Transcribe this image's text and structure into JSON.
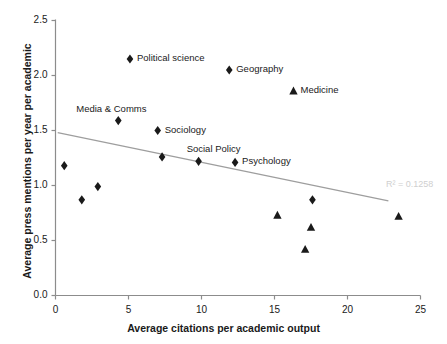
{
  "figure": {
    "title_faint": "",
    "background": "#ffffff",
    "marker_color": "#1a1a1a",
    "axis_color": "#8c8c8c",
    "trend_color": "#9e9e9e",
    "r2_color": "#cfcfcf"
  },
  "chart_data": {
    "type": "scatter",
    "title": "",
    "xlabel": "Average citations per academic output",
    "ylabel": "Average press mentions per year per academic",
    "xlim": [
      0,
      25
    ],
    "ylim": [
      0.0,
      2.5
    ],
    "xticks": [
      0,
      5,
      10,
      15,
      20,
      25
    ],
    "xtick_labels": [
      "0",
      "5",
      "10",
      "15",
      "20",
      "25"
    ],
    "yticks": [
      0.0,
      0.5,
      1.0,
      1.5,
      2.0,
      2.5
    ],
    "ytick_labels": [
      "0.0",
      "0.5",
      "1.0",
      "1.5",
      "2.0",
      "2.5"
    ],
    "grid": false,
    "legend": "none",
    "series": [
      {
        "name": "Social sciences",
        "marker": "diamond",
        "color": "#1a1a1a",
        "points": [
          {
            "x": 5.1,
            "y": 2.15,
            "label": "Political science",
            "label_pos": "right"
          },
          {
            "x": 11.9,
            "y": 2.05,
            "label": "Geography",
            "label_pos": "right"
          },
          {
            "x": 4.3,
            "y": 1.59,
            "label": "Media & Comms",
            "label_pos": "above-left"
          },
          {
            "x": 7.0,
            "y": 1.5,
            "label": "Sociology",
            "label_pos": "right"
          },
          {
            "x": 7.3,
            "y": 1.26,
            "label": "",
            "label_pos": "none"
          },
          {
            "x": 9.8,
            "y": 1.22,
            "label": "Social Policy",
            "label_pos": "above"
          },
          {
            "x": 12.3,
            "y": 1.21,
            "label": "Psychology",
            "label_pos": "right"
          },
          {
            "x": 0.6,
            "y": 1.18,
            "label": "",
            "label_pos": "none"
          },
          {
            "x": 2.9,
            "y": 0.99,
            "label": "",
            "label_pos": "none"
          },
          {
            "x": 1.8,
            "y": 0.87,
            "label": "",
            "label_pos": "none"
          },
          {
            "x": 17.6,
            "y": 0.87,
            "label": "",
            "label_pos": "none"
          }
        ]
      },
      {
        "name": "Sciences",
        "marker": "triangle",
        "color": "#1a1a1a",
        "points": [
          {
            "x": 16.3,
            "y": 1.86,
            "label": "Medicine",
            "label_pos": "right"
          },
          {
            "x": 15.2,
            "y": 0.73,
            "label": "",
            "label_pos": "none"
          },
          {
            "x": 23.5,
            "y": 0.72,
            "label": "",
            "label_pos": "none"
          },
          {
            "x": 17.5,
            "y": 0.62,
            "label": "",
            "label_pos": "none"
          },
          {
            "x": 17.1,
            "y": 0.42,
            "label": "",
            "label_pos": "none"
          }
        ]
      }
    ],
    "trendline": {
      "x0": 0.15,
      "y0": 1.48,
      "x1": 22.8,
      "y1": 0.86,
      "color": "#9e9e9e",
      "annotation": "R² = 0.1258"
    }
  }
}
